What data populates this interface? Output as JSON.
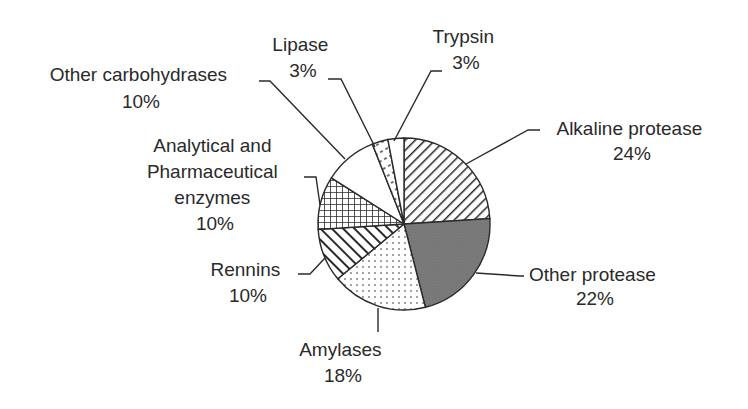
{
  "chart_data": {
    "type": "pie",
    "title": "",
    "start_angle_deg": 0,
    "direction": "clockwise",
    "categories": [
      "Alkaline protease",
      "Other protease",
      "Amylases",
      "Rennins",
      "Analytical and Pharmaceutical enzymes",
      "Other carbohydrases",
      "Lipase",
      "Trypsin"
    ],
    "values": [
      24,
      22,
      18,
      10,
      10,
      10,
      3,
      3
    ],
    "value_labels": [
      "24%",
      "22%",
      "18%",
      "10%",
      "10%",
      "10%",
      "3%",
      "3%"
    ],
    "fills": [
      "diagonal-hatch",
      "dark-gray-solid",
      "dots",
      "diagonal-hatch-bold",
      "crosshatch",
      "white",
      "dashed-hatch",
      "white"
    ],
    "legend": "none (callout labels)"
  },
  "labels": {
    "alkaline": {
      "lines": [
        "Alkaline protease",
        "24%"
      ]
    },
    "other_protease": {
      "lines": [
        "Other protease",
        "22%"
      ]
    },
    "amylases": {
      "lines": [
        "Amylases",
        "18%"
      ]
    },
    "rennins": {
      "lines": [
        "Rennins",
        "10%"
      ]
    },
    "analytical": {
      "lines": [
        "Analytical and",
        "Pharmaceutical",
        "enzymes",
        "10%"
      ]
    },
    "other_carb": {
      "lines": [
        "Other carbohydrases",
        "10%"
      ]
    },
    "lipase": {
      "lines": [
        "Lipase",
        "3%"
      ]
    },
    "trypsin": {
      "lines": [
        "Trypsin",
        "3%"
      ]
    }
  },
  "colors": {
    "stroke": "#2a2a2a",
    "dark_fill": "#7a7a7a",
    "background": "#ffffff"
  }
}
